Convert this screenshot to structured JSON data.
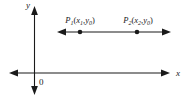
{
  "figure": {
    "background_color": "#ffffff",
    "stroke_color": "#1a1a1a",
    "axes": {
      "x_label": "x",
      "y_label": "y",
      "origin_label": "0"
    },
    "line": {
      "description": "horizontal double-headed arrow",
      "y": 32
    },
    "points": [
      {
        "name": "P",
        "index": "1",
        "coord_x": "x",
        "coord_x_sub": "1",
        "coord_y": "y",
        "coord_y_sub": "0",
        "open_paren": "(",
        "comma": ",",
        "close_paren": ")",
        "cx": 80,
        "cy": 32
      },
      {
        "name": "P",
        "index": "2",
        "coord_x": "x",
        "coord_x_sub": "2",
        "coord_y": "y",
        "coord_y_sub": "0",
        "open_paren": "(",
        "comma": ",",
        "close_paren": ")",
        "cx": 137,
        "cy": 32
      }
    ]
  }
}
